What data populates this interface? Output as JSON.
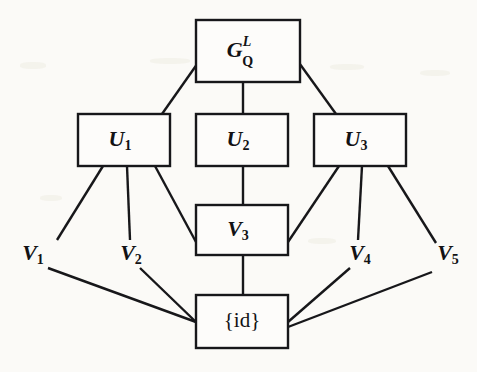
{
  "figure": {
    "type": "lattice-diagram",
    "background_color": "#fbfaf7",
    "ink_color": "#17171a",
    "width": 477,
    "height": 372
  },
  "nodes": {
    "top": {
      "id": "G_Q_L",
      "base": "G",
      "superscript": "L",
      "subscript": "Q",
      "box": {
        "x": 196,
        "y": 20,
        "w": 104,
        "h": 62
      }
    },
    "u1": {
      "id": "U1",
      "base": "U",
      "subscript": "1",
      "box": {
        "x": 78,
        "y": 114,
        "w": 92,
        "h": 52
      }
    },
    "u2": {
      "id": "U2",
      "base": "U",
      "subscript": "2",
      "box": {
        "x": 196,
        "y": 114,
        "w": 92,
        "h": 52
      }
    },
    "u3": {
      "id": "U3",
      "base": "U",
      "subscript": "3",
      "box": {
        "x": 314,
        "y": 114,
        "w": 92,
        "h": 52
      }
    },
    "v3": {
      "id": "V3",
      "base": "V",
      "subscript": "3",
      "box": {
        "x": 196,
        "y": 205,
        "w": 92,
        "h": 50
      }
    },
    "identity": {
      "id": "id",
      "label": "{id}",
      "box": {
        "x": 196,
        "y": 295,
        "w": 92,
        "h": 53
      }
    }
  },
  "free_labels": [
    {
      "id": "V1",
      "base": "V",
      "subscript": "1",
      "x": 33,
      "y": 255
    },
    {
      "id": "V2",
      "base": "V",
      "subscript": "2",
      "x": 131,
      "y": 255
    },
    {
      "id": "V4",
      "base": "V",
      "subscript": "4",
      "x": 360,
      "y": 255
    },
    {
      "id": "V5",
      "base": "V",
      "subscript": "5",
      "x": 448,
      "y": 255
    }
  ],
  "edges": [
    {
      "from": "G_Q_L",
      "to": "U1",
      "x1": 200,
      "y1": 60,
      "x2": 162,
      "y2": 114
    },
    {
      "from": "G_Q_L",
      "to": "U2",
      "x1": 243,
      "y1": 82,
      "x2": 243,
      "y2": 114
    },
    {
      "from": "G_Q_L",
      "to": "U3",
      "x1": 297,
      "y1": 60,
      "x2": 336,
      "y2": 114
    },
    {
      "from": "U1",
      "to": "V1",
      "x1": 103,
      "y1": 166,
      "x2": 57,
      "y2": 240
    },
    {
      "from": "U1",
      "to": "V2",
      "x1": 127,
      "y1": 166,
      "x2": 130,
      "y2": 240
    },
    {
      "from": "U1",
      "to": "V3",
      "x1": 155,
      "y1": 166,
      "x2": 196,
      "y2": 242
    },
    {
      "from": "U2",
      "to": "V3",
      "x1": 243,
      "y1": 166,
      "x2": 243,
      "y2": 205
    },
    {
      "from": "U3",
      "to": "V3",
      "x1": 339,
      "y1": 166,
      "x2": 288,
      "y2": 242
    },
    {
      "from": "U3",
      "to": "V4",
      "x1": 362,
      "y1": 166,
      "x2": 358,
      "y2": 240
    },
    {
      "from": "U3",
      "to": "V5",
      "x1": 388,
      "y1": 166,
      "x2": 436,
      "y2": 243
    },
    {
      "from": "V1",
      "to": "id",
      "x1": 48,
      "y1": 268,
      "x2": 196,
      "y2": 322
    },
    {
      "from": "V2",
      "to": "id",
      "x1": 140,
      "y1": 268,
      "x2": 196,
      "y2": 322
    },
    {
      "from": "V3",
      "to": "id",
      "x1": 243,
      "y1": 255,
      "x2": 243,
      "y2": 295
    },
    {
      "from": "V4",
      "to": "id",
      "x1": 350,
      "y1": 268,
      "x2": 288,
      "y2": 322
    },
    {
      "from": "V5",
      "to": "id",
      "x1": 432,
      "y1": 272,
      "x2": 288,
      "y2": 327
    }
  ]
}
